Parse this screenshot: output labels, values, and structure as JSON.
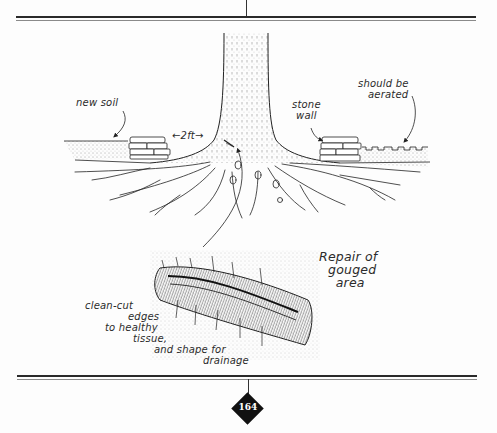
{
  "figure": {
    "title": "Repair of gouged area",
    "title_lines": [
      "Repair of",
      "gouged",
      "area"
    ],
    "labels": {
      "new_soil": "new soil",
      "distance": "←2ft→",
      "stone_wall_lines": [
        "stone",
        "wall"
      ],
      "aerated_lines": [
        "should be",
        "aerated"
      ],
      "clean_cut_lines": [
        "clean-cut",
        "edges",
        "to healthy",
        "tissue,",
        "and shape for",
        "drainage"
      ]
    }
  },
  "footer": {
    "page_number": "164"
  },
  "colors": {
    "ink": "#222222",
    "paper": "#fdfdfd",
    "badge": "#111111"
  }
}
